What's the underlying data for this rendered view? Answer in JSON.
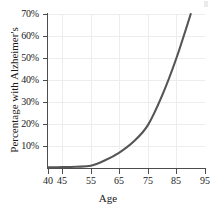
{
  "chart_data": {
    "type": "line",
    "title": "",
    "xlabel": "Age",
    "ylabel": "Percentage with Alzheimer's",
    "xlim": [
      40,
      95
    ],
    "ylim": [
      0,
      70
    ],
    "grid": true,
    "legend": null,
    "line_color": "#555555",
    "grid_color": "#ededed",
    "axis_color": "#4d4d4d",
    "x_ticks": [
      {
        "value": 40,
        "label": "40"
      },
      {
        "value": 45,
        "label": "45"
      },
      {
        "value": 55,
        "label": "55"
      },
      {
        "value": 65,
        "label": "65"
      },
      {
        "value": 75,
        "label": "75"
      },
      {
        "value": 85,
        "label": "85"
      },
      {
        "value": 95,
        "label": "95"
      }
    ],
    "y_ticks": [
      {
        "value": 10,
        "label": "10%"
      },
      {
        "value": 20,
        "label": "20%"
      },
      {
        "value": 30,
        "label": "30%"
      },
      {
        "value": 40,
        "label": "40%"
      },
      {
        "value": 50,
        "label": "50%"
      },
      {
        "value": 60,
        "label": "60%"
      },
      {
        "value": 70,
        "label": "70%"
      }
    ],
    "series": [
      {
        "name": "Percentage with Alzheimer's",
        "x": [
          40,
          45,
          50,
          55,
          60,
          65,
          70,
          75,
          80,
          85,
          90
        ],
        "values": [
          0.3,
          0.4,
          0.6,
          1.0,
          3.5,
          7.0,
          12.0,
          19.5,
          33.0,
          50.0,
          70.0
        ]
      }
    ]
  }
}
